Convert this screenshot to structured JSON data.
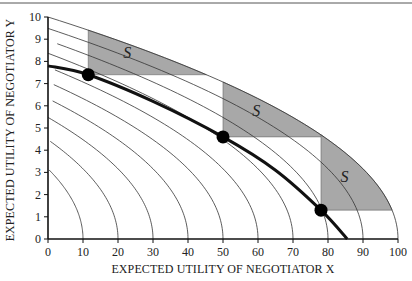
{
  "chart_data": {
    "type": "line",
    "title": "",
    "xlabel": "EXPECTED UTILITY OF NEGOTIATOR X",
    "ylabel": "EXPECTED UTILITY OF NEGOTIATOR Y",
    "xlim": [
      0,
      100
    ],
    "ylim": [
      0,
      10
    ],
    "x_ticks": [
      0,
      10,
      20,
      30,
      40,
      50,
      60,
      70,
      80,
      90,
      100
    ],
    "y_ticks": [
      0,
      1,
      2,
      3,
      4,
      5,
      6,
      7,
      8,
      9,
      10
    ],
    "grid": false,
    "legend": null,
    "indifference_curves": {
      "description": "Family of thin curves x = a - y^2, x-intercepts at a, y-intercepts at sqrt(a)",
      "x_intercepts": [
        10,
        20,
        30,
        40,
        50,
        60,
        70,
        80,
        90,
        100
      ],
      "y_intercepts": [
        3.16,
        4.47,
        5.48,
        6.32,
        7.07,
        7.75,
        8.37,
        8.94,
        9.49,
        10
      ]
    },
    "frontier_curve": {
      "name": "thick curve",
      "points": [
        [
          0,
          7.8
        ],
        [
          11.5,
          7.4
        ],
        [
          30,
          6.2
        ],
        [
          50,
          4.6
        ],
        [
          65,
          3.1
        ],
        [
          78,
          1.3
        ],
        [
          85.5,
          0
        ]
      ]
    },
    "status_quo_points": [
      {
        "x": 11.5,
        "y": 7.4
      },
      {
        "x": 50,
        "y": 4.6
      },
      {
        "x": 78,
        "y": 1.3
      }
    ],
    "shaded_regions": [
      {
        "label": "S",
        "x_left": 11.5,
        "y_bottom": 7.4,
        "bounded_by": "outer curve x = 100 - y^2"
      },
      {
        "label": "S",
        "x_left": 50,
        "y_bottom": 4.6,
        "bounded_by": "outer curve x = 100 - y^2"
      },
      {
        "label": "S",
        "x_left": 78,
        "y_bottom": 1.3,
        "bounded_by": "outer curve x = 100 - y^2"
      }
    ],
    "colors": {
      "region_fill": "#a8a8a8",
      "curve": "#333333",
      "frontier": "#111111",
      "point": "#000000"
    }
  },
  "labels": {
    "xlabel": "EXPECTED UTILITY OF NEGOTIATOR X",
    "ylabel": "EXPECTED UTILITY OF NEGOTIATOR Y",
    "region_label": "S",
    "x_ticks": [
      "0",
      "10",
      "20",
      "30",
      "40",
      "50",
      "60",
      "70",
      "80",
      "90",
      "100"
    ],
    "y_ticks": [
      "0",
      "1",
      "2",
      "3",
      "4",
      "5",
      "6",
      "7",
      "8",
      "9",
      "10"
    ]
  }
}
